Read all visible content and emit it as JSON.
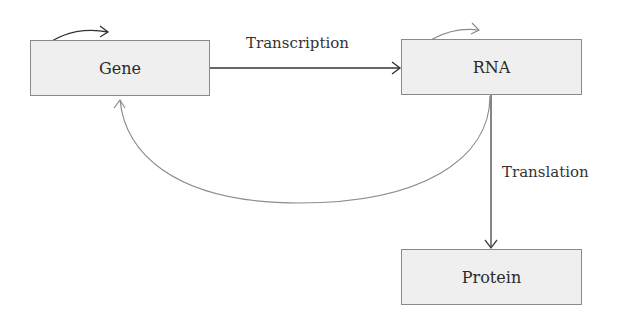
{
  "diagram": {
    "title": "",
    "nodes": [
      {
        "id": "gene",
        "label": "Gene",
        "x": 30,
        "y": 40,
        "w": 180,
        "h": 56
      },
      {
        "id": "rna",
        "label": "RNA",
        "x": 401,
        "y": 39,
        "w": 181,
        "h": 56
      },
      {
        "id": "protein",
        "label": "Protein",
        "x": 401,
        "y": 249,
        "w": 181,
        "h": 56
      }
    ],
    "edges": [
      {
        "from": "gene",
        "to": "rna",
        "label": "Transcription"
      },
      {
        "from": "rna",
        "to": "protein",
        "label": "Translation"
      },
      {
        "from": "rna",
        "to": "gene",
        "label": ""
      },
      {
        "from": "gene",
        "to": "gene",
        "label": "",
        "type": "self-loop-arc"
      },
      {
        "from": "rna",
        "to": "rna",
        "label": "",
        "type": "self-loop-arc"
      }
    ],
    "colors": {
      "box_fill": "#efefef",
      "box_border": "#8a8a8a",
      "arrow_dark": "#333333",
      "arrow_light": "#8c8c8c",
      "text": "#2a2a2a"
    }
  },
  "labels": {
    "gene": "Gene",
    "rna": "RNA",
    "protein": "Protein",
    "transcription": "Transcription",
    "translation": "Translation"
  }
}
